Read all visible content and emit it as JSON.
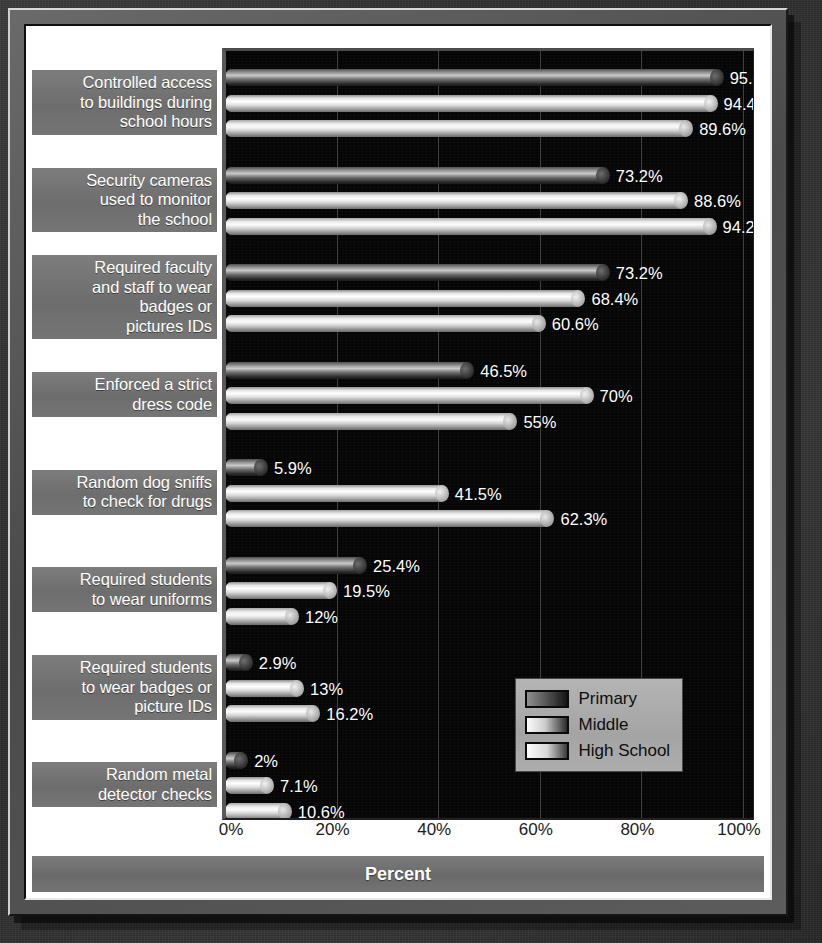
{
  "chart_data": {
    "type": "bar",
    "orientation": "horizontal",
    "title": "",
    "xlabel": "Percent",
    "ylabel": "",
    "xlim": [
      0,
      100
    ],
    "xticks": [
      "0%",
      "20%",
      "40%",
      "60%",
      "80%",
      "100%"
    ],
    "xtick_values": [
      0,
      20,
      40,
      60,
      80,
      100
    ],
    "grid": true,
    "legend_position": "center-right",
    "categories": [
      "Controlled access to buildings during school hours",
      "Security cameras used to monitor the school",
      "Required faculty and staff to wear badges or pictures IDs",
      "Enforced a strict dress code",
      "Random dog sniffs to check for drugs",
      "Required students to wear uniforms",
      "Required students to wear badges or picture IDs",
      "Random metal detector checks"
    ],
    "category_lines": [
      [
        "Controlled access",
        "to buildings during",
        "school hours"
      ],
      [
        "Security cameras",
        "used to monitor",
        "the school"
      ],
      [
        "Required faculty",
        "and staff to wear",
        "badges or",
        "pictures IDs"
      ],
      [
        "Enforced a strict",
        "dress code"
      ],
      [
        "Random dog sniffs",
        "to check for drugs"
      ],
      [
        "Required students",
        "to wear uniforms"
      ],
      [
        "Required students",
        "to wear badges or",
        "picture IDs"
      ],
      [
        "Random metal",
        "detector checks"
      ]
    ],
    "series": [
      {
        "name": "Primary",
        "values": [
          95.6,
          73.2,
          73.2,
          46.5,
          5.9,
          25.4,
          2.9,
          2
        ]
      },
      {
        "name": "Middle",
        "values": [
          94.4,
          88.6,
          68.4,
          70,
          41.5,
          19.5,
          13,
          7.1
        ]
      },
      {
        "name": "High School",
        "values": [
          89.6,
          94.2,
          60.6,
          55,
          62.3,
          12,
          16.2,
          10.6
        ]
      }
    ],
    "data_labels": [
      [
        "95.6%",
        "94.4%",
        "89.6%"
      ],
      [
        "73.2%",
        "88.6%",
        "94.2%"
      ],
      [
        "73.2%",
        "68.4%",
        "60.6%"
      ],
      [
        "46.5%",
        "70%",
        "55%"
      ],
      [
        "5.9%",
        "41.5%",
        "62.3%"
      ],
      [
        "25.4%",
        "19.5%",
        "12%"
      ],
      [
        "2.9%",
        "13%",
        "16.2%"
      ],
      [
        "2%",
        "7.1%",
        "10.6%"
      ]
    ]
  },
  "legend": {
    "items": [
      {
        "label": "Primary",
        "swatch": "primary-swatch"
      },
      {
        "label": "Middle",
        "swatch": "middle-swatch"
      },
      {
        "label": "High School",
        "swatch": "high-school-swatch"
      }
    ]
  },
  "colors": {
    "plot_background": "#050505",
    "label_band": "#6d6d6d",
    "legend_background": "#a9a9a9",
    "frame": "#5a5a5a",
    "text_light": "#ffffff",
    "text_dark": "#0d0d0d"
  }
}
